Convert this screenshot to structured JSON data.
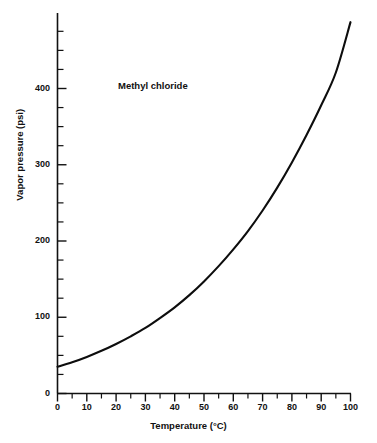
{
  "chart_data": {
    "type": "line",
    "title": "",
    "annotation": "Methyl chloride",
    "xlabel": "Temperature (°C)",
    "ylabel": "Vapor pressure (psi)",
    "xlim": [
      0,
      100
    ],
    "ylim": [
      0,
      487
    ],
    "grid": false,
    "legend": false,
    "x_major_ticks": [
      0,
      10,
      20,
      30,
      40,
      50,
      60,
      70,
      80,
      90,
      100
    ],
    "x_tick_labels": [
      "0",
      "10",
      "20",
      "30",
      "40",
      "50",
      "60",
      "70",
      "80",
      "90",
      "100"
    ],
    "x_minor_step": 5,
    "y_major_ticks": [
      0,
      100,
      200,
      300,
      400
    ],
    "y_tick_labels": [
      "0",
      "100",
      "200",
      "300",
      "400"
    ],
    "y_minor_step": 25,
    "series": [
      {
        "name": "Methyl chloride",
        "color": "#0d0d0d",
        "x": [
          0,
          5,
          10,
          15,
          20,
          25,
          30,
          35,
          40,
          45,
          50,
          55,
          60,
          65,
          70,
          75,
          80,
          85,
          90,
          95,
          100
        ],
        "values": [
          35,
          41,
          48,
          56,
          65,
          75,
          86,
          99,
          113,
          129,
          147,
          167,
          189,
          213,
          240,
          270,
          303,
          339,
          378,
          421,
          487
        ]
      }
    ]
  },
  "axes": {
    "x_title": "Temperature (°C)",
    "y_title": "Vapor pressure (psi)"
  }
}
